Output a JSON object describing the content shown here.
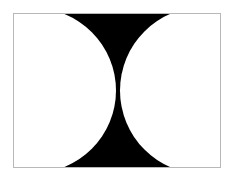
{
  "canvas": {
    "width": 232,
    "height": 177,
    "background": "#ffffff"
  },
  "frame": {
    "x": 13,
    "y": 13,
    "width": 208,
    "height": 155,
    "fill": "#000000",
    "stroke": "#b8b8b8"
  },
  "shapes": [
    {
      "name": "left-circle",
      "cx": 33.5,
      "cy": 90.5,
      "r": 82.5,
      "fill": "#ffffff"
    },
    {
      "name": "right-circle",
      "cx": 203.5,
      "cy": 90.5,
      "r": 83.5,
      "fill": "#ffffff"
    }
  ]
}
